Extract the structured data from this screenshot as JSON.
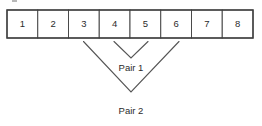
{
  "diagram": {
    "cells": [
      {
        "label": "1"
      },
      {
        "label": "2"
      },
      {
        "label": "3"
      },
      {
        "label": "4"
      },
      {
        "label": "5"
      },
      {
        "label": "6"
      },
      {
        "label": "7"
      },
      {
        "label": "8"
      }
    ],
    "connectors": [
      {
        "name": "pair-1",
        "label": "Pair 1"
      },
      {
        "name": "pair-2",
        "label": "Pair 2"
      }
    ],
    "colors": {
      "cell_border": "#4a4a4a",
      "frame_border": "#3d3d3d",
      "connector_line": "#555555",
      "text": "#2b2b2b",
      "background": "#ffffff"
    }
  }
}
